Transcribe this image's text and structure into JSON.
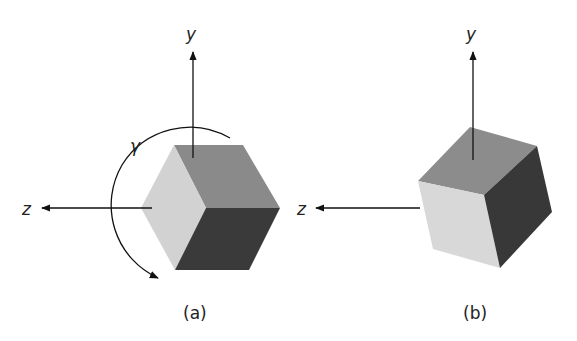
{
  "figure": {
    "panels": [
      {
        "id": "a",
        "caption": "(a)",
        "axes": {
          "y_label": "y",
          "z_label": "z"
        },
        "rotation_label": "γ",
        "faces": {
          "top": "#8a8a8a",
          "left": "#d2d2d2",
          "right": "#3a3a3a"
        }
      },
      {
        "id": "b",
        "caption": "(b)",
        "axes": {
          "y_label": "y",
          "z_label": "z"
        },
        "faces": {
          "top": "#8c8c8c",
          "front": "#d8d8d8",
          "right": "#383838"
        }
      }
    ]
  }
}
